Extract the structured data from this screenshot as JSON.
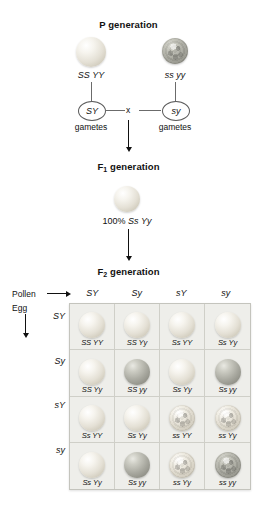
{
  "diagram": {
    "p_generation": {
      "heading": "P generation",
      "parents": [
        {
          "genotype": "SS YY",
          "phenotype": "smooth-yellow",
          "gamete": "SY",
          "gamete_label": "gametes"
        },
        {
          "genotype": "ss yy",
          "phenotype": "wrinkled-green",
          "gamete": "sy",
          "gamete_label": "gametes"
        }
      ],
      "cross_symbol": "x"
    },
    "f1_generation": {
      "heading": "F",
      "heading_sub": "1",
      "heading_rest": " generation",
      "offspring_phenotype": "smooth-yellow",
      "result_prefix": "100% ",
      "result_genotype": "Ss Yy"
    },
    "f2_generation": {
      "heading": "F",
      "heading_sub": "2",
      "heading_rest": " generation",
      "pollen_label": "Pollen",
      "egg_label": "Egg",
      "pollen_gametes": [
        "SY",
        "Sy",
        "sY",
        "sy"
      ],
      "egg_gametes": [
        "SY",
        "Sy",
        "sY",
        "sy"
      ],
      "cells": [
        {
          "genotype": "SS YY",
          "phenotype": "smooth-yellow"
        },
        {
          "genotype": "SS Yy",
          "phenotype": "smooth-yellow"
        },
        {
          "genotype": "Ss YY",
          "phenotype": "smooth-yellow"
        },
        {
          "genotype": "Ss Yy",
          "phenotype": "smooth-yellow"
        },
        {
          "genotype": "SS Yy",
          "phenotype": "smooth-yellow"
        },
        {
          "genotype": "SS yy",
          "phenotype": "smooth-green"
        },
        {
          "genotype": "Ss Yy",
          "phenotype": "smooth-yellow"
        },
        {
          "genotype": "Ss yy",
          "phenotype": "smooth-green"
        },
        {
          "genotype": "Ss YY",
          "phenotype": "smooth-yellow"
        },
        {
          "genotype": "Ss Yy",
          "phenotype": "smooth-yellow"
        },
        {
          "genotype": "ss YY",
          "phenotype": "wrinkled-yellow"
        },
        {
          "genotype": "ss Yy",
          "phenotype": "wrinkled-yellow"
        },
        {
          "genotype": "Ss Yy",
          "phenotype": "smooth-yellow"
        },
        {
          "genotype": "Ss yy",
          "phenotype": "smooth-green"
        },
        {
          "genotype": "ss Yy",
          "phenotype": "wrinkled-yellow"
        },
        {
          "genotype": "ss yy",
          "phenotype": "wrinkled-green"
        }
      ]
    },
    "colors": {
      "grid_background": "#e9e9e5",
      "grid_border": "#c4c4bd",
      "cell_background": "#eeeeea",
      "line": "#6b6b6b",
      "text": "#1b1b1b"
    }
  }
}
